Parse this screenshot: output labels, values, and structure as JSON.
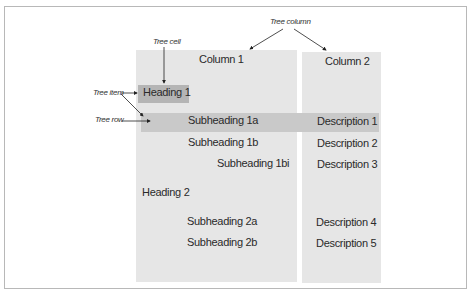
{
  "annotations": {
    "tree_column": "Tree column",
    "tree_cell": "Tree cell",
    "tree_item": "Tree item",
    "tree_row": "Tree row"
  },
  "columns": [
    {
      "header": "Column 1"
    },
    {
      "header": "Column 2"
    }
  ],
  "rows": [
    {
      "label": "Heading 1",
      "description": "",
      "level": 0
    },
    {
      "label": "Subheading 1a",
      "description": "Description 1",
      "level": 1
    },
    {
      "label": "Subheading 1b",
      "description": "Description 2",
      "level": 1
    },
    {
      "label": "Subheading 1bi",
      "description": "Description 3",
      "level": 2
    },
    {
      "label": "Heading 2",
      "description": "",
      "level": 0
    },
    {
      "label": "Subheading 2a",
      "description": "Description 4",
      "level": 1
    },
    {
      "label": "Subheading 2b",
      "description": "Description 5",
      "level": 1
    }
  ],
  "colors": {
    "column_bg": "#e6e6e6",
    "row_highlight": "#c9c9c9",
    "cell_highlight": "#b5b5b5"
  }
}
